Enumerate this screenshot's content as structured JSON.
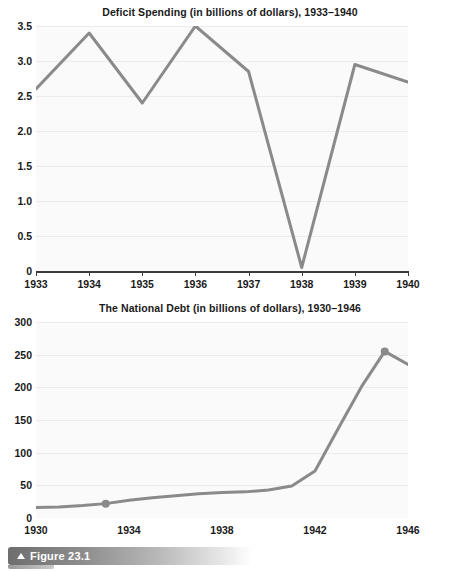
{
  "figure": {
    "label": "Figure 23.1",
    "marker_icon": "triangle-up-icon"
  },
  "colors": {
    "line": "#8a8a8a",
    "plot_background": "#fafafa",
    "gridline": "#ececec",
    "axis": "#3a3a3a",
    "text": "#1a1a1a"
  },
  "chart_data": [
    {
      "id": "deficit-spending",
      "type": "line",
      "title": "Deficit Spending (in billions of dollars), 1933–1940",
      "xlabel": "",
      "ylabel": "",
      "x": [
        1933,
        1934,
        1935,
        1936,
        1937,
        1938,
        1939,
        1940
      ],
      "values": [
        2.6,
        3.4,
        2.4,
        3.5,
        2.85,
        0.05,
        2.95,
        2.7
      ],
      "xlim": [
        1933,
        1940
      ],
      "ylim": [
        0,
        3.5
      ],
      "xticks": [
        1933,
        1934,
        1935,
        1936,
        1937,
        1938,
        1939,
        1940
      ],
      "xticklabels": [
        "1933",
        "1934",
        "1935",
        "1936",
        "1937",
        "1938",
        "1939",
        "1940"
      ],
      "yticks": [
        0,
        0.5,
        1.0,
        1.5,
        2.0,
        2.5,
        3.0,
        3.5
      ],
      "yticklabels": [
        "0",
        "0.5",
        "1.0",
        "1.5",
        "2.0",
        "2.5",
        "3.0",
        "3.5"
      ],
      "grid": true,
      "legend": false,
      "markers": []
    },
    {
      "id": "national-debt",
      "type": "line",
      "title": "The National Debt (in billions of dollars), 1930–1946",
      "xlabel": "",
      "ylabel": "",
      "x": [
        1930,
        1931,
        1932,
        1933,
        1934,
        1935,
        1936,
        1937,
        1938,
        1939,
        1940,
        1941,
        1942,
        1943,
        1944,
        1945,
        1946
      ],
      "values": [
        16,
        17,
        19,
        22,
        27,
        31,
        34,
        37,
        39,
        40,
        43,
        49,
        72,
        137,
        201,
        255,
        235
      ],
      "xlim": [
        1930,
        1946
      ],
      "ylim": [
        0,
        300
      ],
      "xticks": [
        1930,
        1931,
        1932,
        1933,
        1934,
        1935,
        1936,
        1937,
        1938,
        1939,
        1940,
        1941,
        1942,
        1943,
        1944,
        1945,
        1946
      ],
      "xticklabels_shown": [
        "1930",
        "1934",
        "1938",
        "1942",
        "1946"
      ],
      "xticklabel_years": [
        1930,
        1934,
        1938,
        1942,
        1946
      ],
      "yticks": [
        0,
        50,
        100,
        150,
        200,
        250,
        300
      ],
      "yticklabels": [
        "0",
        "50",
        "100",
        "150",
        "200",
        "250",
        "300"
      ],
      "grid": true,
      "legend": false,
      "markers": [
        {
          "x": 1933,
          "y": 22
        },
        {
          "x": 1945,
          "y": 255
        }
      ]
    }
  ]
}
